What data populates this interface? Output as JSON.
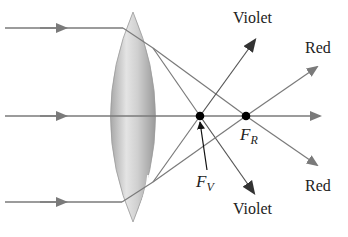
{
  "diagram": {
    "colors": {
      "ray": "#7a7a7a",
      "pointer": "#333333",
      "focal_point": "#000000",
      "lens_light": "#e6e6e6",
      "lens_dark": "#9a9a9a",
      "text": "#222222"
    },
    "labels": {
      "violet_top": "Violet",
      "red_top": "Red",
      "red_bottom": "Red",
      "violet_bottom": "Violet",
      "fv_main": "F",
      "fv_sub": "V",
      "fr_main": "F",
      "fr_sub": "R"
    },
    "geometry": {
      "axis_y": 116,
      "incoming_rays_y": [
        28,
        116,
        202
      ],
      "lens": {
        "x_left": 105,
        "x_right": 162,
        "y_top": 12,
        "y_bottom": 222
      },
      "focal_violet": {
        "x": 200,
        "y": 116
      },
      "focal_red": {
        "x": 246,
        "y": 116
      }
    }
  }
}
